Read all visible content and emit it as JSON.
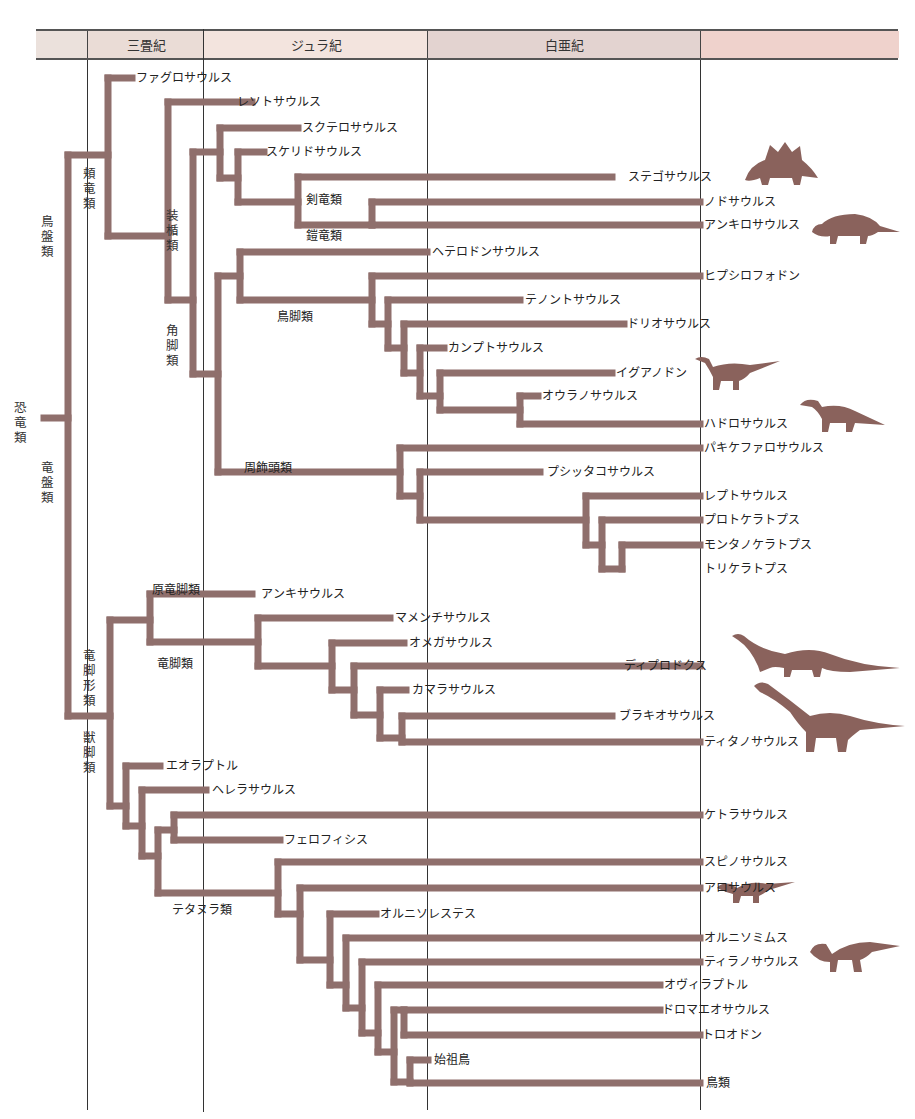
{
  "periods": {
    "header": [
      {
        "label": "",
        "x": 36,
        "w": 51,
        "color": "#ebe1dc"
      },
      {
        "label": "三畳紀",
        "x": 87,
        "w": 116,
        "color": "#eadcd6"
      },
      {
        "label": "ジュラ紀",
        "x": 203,
        "w": 224,
        "color": "#f3e4de"
      },
      {
        "label": "白亜紀",
        "x": 427,
        "w": 273,
        "color": "#e3d3d0"
      },
      {
        "label": "",
        "x": 700,
        "w": 198,
        "color": "#efd2cc"
      }
    ],
    "boundaries": [
      87,
      203,
      427,
      700
    ]
  },
  "colors": {
    "branch": "#8f6f6c",
    "silhouette": "#8a625c",
    "rule": "#333333"
  },
  "branch_width": 7,
  "segments": [
    [
      44,
      418,
      68,
      418
    ],
    [
      68,
      155,
      68,
      716
    ],
    [
      68,
      155,
      108,
      155
    ],
    [
      108,
      78,
      108,
      236
    ],
    [
      108,
      78,
      132,
      78
    ],
    [
      108,
      236,
      168,
      236
    ],
    [
      168,
      102,
      168,
      300
    ],
    [
      168,
      102,
      252,
      102
    ],
    [
      168,
      300,
      193,
      300
    ],
    [
      193,
      152,
      193,
      374
    ],
    [
      193,
      152,
      220,
      152
    ],
    [
      220,
      128,
      220,
      178
    ],
    [
      220,
      128,
      298,
      128
    ],
    [
      220,
      178,
      238,
      178
    ],
    [
      238,
      152,
      238,
      202
    ],
    [
      238,
      152,
      264,
      152
    ],
    [
      238,
      202,
      298,
      202
    ],
    [
      298,
      177,
      298,
      225
    ],
    [
      298,
      177,
      612,
      177
    ],
    [
      298,
      225,
      372,
      225
    ],
    [
      372,
      202,
      372,
      225
    ],
    [
      372,
      202,
      700,
      202
    ],
    [
      372,
      225,
      700,
      225
    ],
    [
      193,
      374,
      218,
      374
    ],
    [
      218,
      276,
      218,
      472
    ],
    [
      218,
      276,
      240,
      276
    ],
    [
      240,
      252,
      240,
      300
    ],
    [
      240,
      252,
      427,
      252
    ],
    [
      240,
      300,
      372,
      300
    ],
    [
      372,
      276,
      372,
      324
    ],
    [
      372,
      276,
      700,
      276
    ],
    [
      372,
      324,
      388,
      324
    ],
    [
      388,
      300,
      388,
      348
    ],
    [
      388,
      300,
      520,
      300
    ],
    [
      388,
      348,
      404,
      348
    ],
    [
      404,
      324,
      404,
      373
    ],
    [
      404,
      324,
      624,
      324
    ],
    [
      404,
      373,
      420,
      373
    ],
    [
      420,
      348,
      420,
      396
    ],
    [
      420,
      348,
      444,
      348
    ],
    [
      420,
      396,
      440,
      396
    ],
    [
      440,
      373,
      440,
      410
    ],
    [
      440,
      373,
      612,
      373
    ],
    [
      440,
      410,
      520,
      410
    ],
    [
      520,
      396,
      520,
      424
    ],
    [
      520,
      396,
      538,
      396
    ],
    [
      520,
      424,
      700,
      424
    ],
    [
      218,
      472,
      400,
      472
    ],
    [
      400,
      448,
      400,
      496
    ],
    [
      400,
      448,
      700,
      448
    ],
    [
      400,
      496,
      420,
      496
    ],
    [
      420,
      472,
      420,
      520
    ],
    [
      420,
      472,
      540,
      472
    ],
    [
      420,
      520,
      586,
      520
    ],
    [
      586,
      496,
      586,
      545
    ],
    [
      586,
      496,
      700,
      496
    ],
    [
      586,
      545,
      602,
      545
    ],
    [
      602,
      520,
      602,
      569
    ],
    [
      602,
      520,
      700,
      520
    ],
    [
      602,
      569,
      622,
      569
    ],
    [
      622,
      545,
      622,
      569
    ],
    [
      622,
      545,
      700,
      545
    ],
    [
      68,
      716,
      110,
      716
    ],
    [
      110,
      620,
      110,
      806
    ],
    [
      110,
      620,
      150,
      620
    ],
    [
      150,
      594,
      150,
      642
    ],
    [
      150,
      594,
      252,
      594
    ],
    [
      150,
      642,
      258,
      642
    ],
    [
      258,
      618,
      258,
      666
    ],
    [
      258,
      618,
      390,
      618
    ],
    [
      258,
      666,
      332,
      666
    ],
    [
      332,
      643,
      332,
      690
    ],
    [
      332,
      643,
      404,
      643
    ],
    [
      332,
      690,
      354,
      690
    ],
    [
      354,
      666,
      354,
      715
    ],
    [
      354,
      666,
      700,
      666
    ],
    [
      354,
      715,
      380,
      715
    ],
    [
      380,
      690,
      380,
      738
    ],
    [
      380,
      690,
      406,
      690
    ],
    [
      380,
      738,
      402,
      738
    ],
    [
      402,
      716,
      402,
      742
    ],
    [
      402,
      716,
      612,
      716
    ],
    [
      402,
      742,
      700,
      742
    ],
    [
      110,
      806,
      126,
      806
    ],
    [
      126,
      766,
      126,
      826
    ],
    [
      126,
      766,
      160,
      766
    ],
    [
      126,
      826,
      142,
      826
    ],
    [
      142,
      790,
      142,
      856
    ],
    [
      142,
      790,
      206,
      790
    ],
    [
      142,
      856,
      158,
      856
    ],
    [
      158,
      830,
      158,
      893
    ],
    [
      158,
      830,
      174,
      830
    ],
    [
      174,
      815,
      174,
      840
    ],
    [
      174,
      815,
      700,
      815
    ],
    [
      174,
      840,
      280,
      840
    ],
    [
      158,
      893,
      278,
      893
    ],
    [
      278,
      862,
      278,
      914
    ],
    [
      278,
      862,
      700,
      862
    ],
    [
      278,
      914,
      300,
      914
    ],
    [
      300,
      888,
      300,
      960
    ],
    [
      300,
      888,
      700,
      888
    ],
    [
      300,
      960,
      330,
      960
    ],
    [
      330,
      914,
      330,
      985
    ],
    [
      330,
      914,
      376,
      914
    ],
    [
      330,
      985,
      346,
      985
    ],
    [
      346,
      938,
      346,
      1008
    ],
    [
      346,
      938,
      700,
      938
    ],
    [
      346,
      1008,
      362,
      1008
    ],
    [
      362,
      962,
      362,
      1033
    ],
    [
      362,
      962,
      700,
      962
    ],
    [
      362,
      1033,
      378,
      1033
    ],
    [
      378,
      985,
      378,
      1052
    ],
    [
      378,
      985,
      660,
      985
    ],
    [
      378,
      1052,
      394,
      1052
    ],
    [
      394,
      1010,
      394,
      1082
    ],
    [
      394,
      1010,
      404,
      1010
    ],
    [
      404,
      1010,
      404,
      1035
    ],
    [
      404,
      1010,
      660,
      1010
    ],
    [
      404,
      1035,
      700,
      1035
    ],
    [
      394,
      1082,
      410,
      1082
    ],
    [
      410,
      1060,
      410,
      1083
    ],
    [
      410,
      1060,
      428,
      1060
    ],
    [
      410,
      1083,
      700,
      1083
    ]
  ],
  "taxa": [
    {
      "name": "ファグロサウルス",
      "x": 136,
      "y": 78
    },
    {
      "name": "レソトサウルス",
      "x": 237,
      "y": 102
    },
    {
      "name": "スクテロサウルス",
      "x": 302,
      "y": 128
    },
    {
      "name": "スケリドサウルス",
      "x": 266,
      "y": 152
    },
    {
      "name": "ステゴサウルス",
      "x": 628,
      "y": 177
    },
    {
      "name": "ノドサウルス",
      "x": 704,
      "y": 202
    },
    {
      "name": "アンキロサウルス",
      "x": 704,
      "y": 225
    },
    {
      "name": "ヘテロドンサウルス",
      "x": 432,
      "y": 252
    },
    {
      "name": "ヒプシロフォドン",
      "x": 704,
      "y": 276
    },
    {
      "name": "テノントサウルス",
      "x": 525,
      "y": 300
    },
    {
      "name": "ドリオサウルス",
      "x": 627,
      "y": 324
    },
    {
      "name": "カンプトサウルス",
      "x": 448,
      "y": 348
    },
    {
      "name": "イグアノドン",
      "x": 616,
      "y": 373
    },
    {
      "name": "オウラノサウルス",
      "x": 542,
      "y": 396
    },
    {
      "name": "ハドロサウルス",
      "x": 704,
      "y": 424
    },
    {
      "name": "パキケファロサウルス",
      "x": 704,
      "y": 448
    },
    {
      "name": "プシッタコサウルス",
      "x": 547,
      "y": 472
    },
    {
      "name": "レプトサウルス",
      "x": 704,
      "y": 496
    },
    {
      "name": "プロトケラトプス",
      "x": 704,
      "y": 520
    },
    {
      "name": "モンタノケラトプス",
      "x": 704,
      "y": 545
    },
    {
      "name": "トリケラトプス",
      "x": 704,
      "y": 569
    },
    {
      "name": "アンキサウルス",
      "x": 261,
      "y": 594
    },
    {
      "name": "マメンチサウルス",
      "x": 395,
      "y": 618
    },
    {
      "name": "オメガサウルス",
      "x": 409,
      "y": 643
    },
    {
      "name": "ディプロドクス",
      "x": 624,
      "y": 666
    },
    {
      "name": "カマラサウルス",
      "x": 412,
      "y": 690
    },
    {
      "name": "ブラキオサウルス",
      "x": 619,
      "y": 716
    },
    {
      "name": "ティタノサウルス",
      "x": 704,
      "y": 742
    },
    {
      "name": "エオラプトル",
      "x": 166,
      "y": 766
    },
    {
      "name": "ヘレラサウルス",
      "x": 212,
      "y": 790
    },
    {
      "name": "ケトラサウルス",
      "x": 704,
      "y": 815
    },
    {
      "name": "フェロフィシス",
      "x": 284,
      "y": 840
    },
    {
      "name": "スピノサウルス",
      "x": 704,
      "y": 862
    },
    {
      "name": "アロサウルス",
      "x": 704,
      "y": 888
    },
    {
      "name": "オルニソレステス",
      "x": 380,
      "y": 914
    },
    {
      "name": "オルニソミムス",
      "x": 704,
      "y": 938
    },
    {
      "name": "ティラノサウルス",
      "x": 704,
      "y": 962
    },
    {
      "name": "オヴィラプトル",
      "x": 664,
      "y": 985
    },
    {
      "name": "ドロマエオサウルス",
      "x": 662,
      "y": 1010
    },
    {
      "name": "トロオドン",
      "x": 702,
      "y": 1035
    },
    {
      "name": "始祖鳥",
      "x": 434,
      "y": 1060
    },
    {
      "name": "鳥類",
      "x": 706,
      "y": 1083
    }
  ],
  "clade_labels_horizontal": [
    {
      "name": "剣竜類",
      "x": 306,
      "y": 200
    },
    {
      "name": "鎧竜類",
      "x": 306,
      "y": 236
    },
    {
      "name": "鳥脚類",
      "x": 277,
      "y": 317
    },
    {
      "name": "周飾頭類",
      "x": 244,
      "y": 468
    },
    {
      "name": "原竜脚類",
      "x": 152,
      "y": 590
    },
    {
      "name": "竜脚類",
      "x": 157,
      "y": 664
    },
    {
      "name": "テタヌラ類",
      "x": 172,
      "y": 910
    }
  ],
  "clade_labels_vertical": [
    {
      "name": "恐竜類",
      "x": 20,
      "y": 400
    },
    {
      "name": "鳥盤類",
      "x": 47,
      "y": 214
    },
    {
      "name": "竜盤類",
      "x": 47,
      "y": 460
    },
    {
      "name": "頬竜類",
      "x": 89,
      "y": 166
    },
    {
      "name": "装楯類",
      "x": 172,
      "y": 208
    },
    {
      "name": "角脚類",
      "x": 172,
      "y": 323
    },
    {
      "name": "竜脚形類",
      "x": 89,
      "y": 648
    },
    {
      "name": "獣脚類",
      "x": 89,
      "y": 730
    }
  ],
  "silhouettes": [
    {
      "kind": "stegosaur-icon",
      "x": 740,
      "y": 140,
      "w": 78,
      "h": 45
    },
    {
      "kind": "ankylosaur-icon",
      "x": 810,
      "y": 210,
      "w": 90,
      "h": 36
    },
    {
      "kind": "iguanodon-icon",
      "x": 695,
      "y": 355,
      "w": 85,
      "h": 35
    },
    {
      "kind": "hadrosaur-icon",
      "x": 800,
      "y": 397,
      "w": 85,
      "h": 35
    },
    {
      "kind": "diplodocus-icon",
      "x": 730,
      "y": 632,
      "w": 170,
      "h": 45
    },
    {
      "kind": "titanosaur-icon",
      "x": 750,
      "y": 680,
      "w": 155,
      "h": 72
    },
    {
      "kind": "allosaur-icon",
      "x": 717,
      "y": 878,
      "w": 78,
      "h": 25
    },
    {
      "kind": "tyrannosaur-icon",
      "x": 810,
      "y": 938,
      "w": 90,
      "h": 36
    }
  ]
}
